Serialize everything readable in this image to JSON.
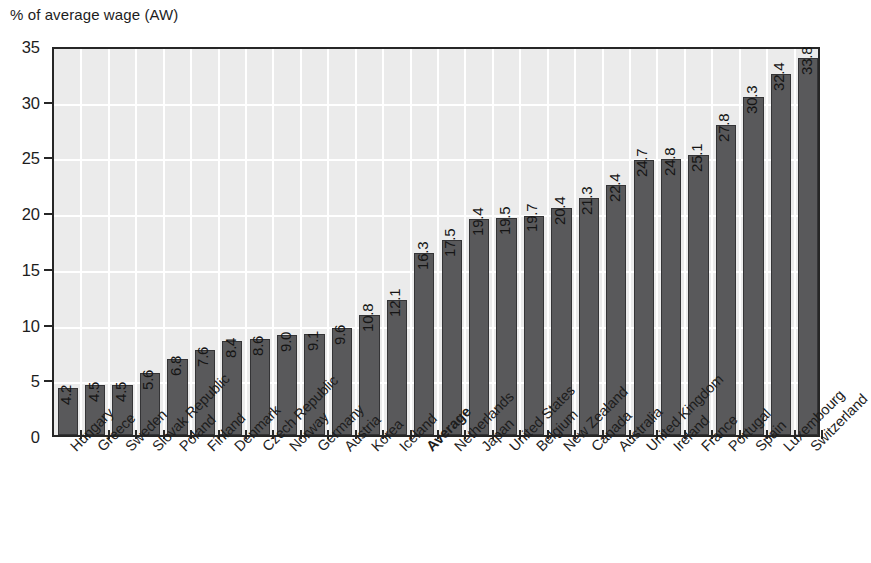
{
  "chart_data": {
    "type": "bar",
    "title": "",
    "ylabel": "% of average wage (AW)",
    "xlabel": "",
    "ylim": [
      0,
      35
    ],
    "yticks": [
      0,
      5,
      10,
      15,
      20,
      25,
      30,
      35
    ],
    "grid": true,
    "legend": "none",
    "value_labels": true,
    "highlight_category": "Average",
    "bar_color": "#59595b",
    "plot_background": "#ebebeb",
    "gridline_color": "#ffffff",
    "frame_color": "#262626",
    "categories": [
      "Hungary",
      "Greece",
      "Sweden",
      "Slovak Republic",
      "Poland",
      "Finland",
      "Denmark",
      "Czech Republic",
      "Norway",
      "Germany",
      "Austria",
      "Korea",
      "Iceland",
      "Average",
      "Netherlands",
      "Japan",
      "United States",
      "Belgium",
      "New Zealand",
      "Canada",
      "Australia",
      "United Kingdom",
      "Ireland",
      "France",
      "Portugal",
      "Spain",
      "Luxembourg",
      "Switzerland"
    ],
    "values": [
      4.2,
      4.5,
      4.5,
      5.6,
      6.8,
      7.6,
      8.4,
      8.6,
      9.0,
      9.1,
      9.6,
      10.8,
      12.1,
      16.3,
      17.5,
      19.4,
      19.5,
      19.7,
      20.4,
      21.3,
      22.4,
      24.7,
      24.8,
      25.1,
      27.8,
      30.3,
      32.4,
      33.8
    ],
    "value_label_strings": [
      "4.2",
      "4.5",
      "4.5",
      "5.6",
      "6.8",
      "7.6",
      "8.4",
      "8.6",
      "9.0",
      "9.1",
      "9.6",
      "10.8",
      "12.1",
      "16.3",
      "17.5",
      "19.4",
      "19.5",
      "19.7",
      "20.4",
      "21.3",
      "22.4",
      "24.7",
      "24.8",
      "25.1",
      "27.8",
      "30.3",
      "32.4",
      "33.8"
    ],
    "ytick_labels": [
      "0",
      "5",
      "10",
      "15",
      "20",
      "25",
      "30",
      "35"
    ]
  }
}
